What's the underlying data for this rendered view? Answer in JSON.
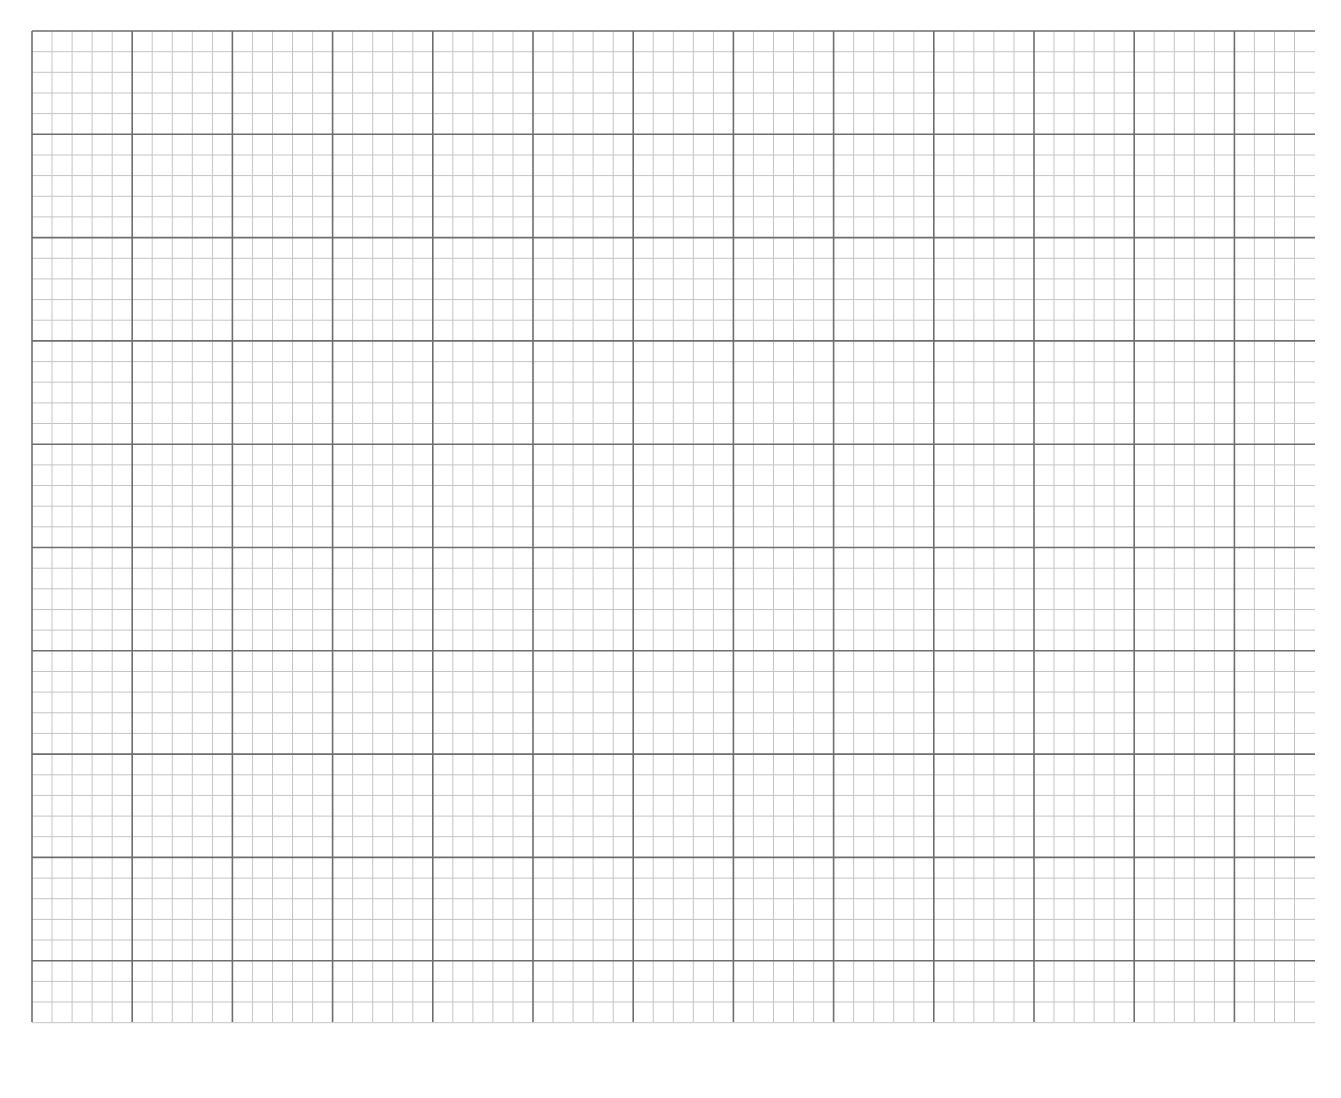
{
  "page": {
    "title": "",
    "background": "#ffffff"
  },
  "grid": {
    "origin_x": 32,
    "origin_y": 31,
    "major_step_x": 100.2,
    "major_step_y": 103.3,
    "minor_per_major": 5,
    "vertical_line_count": 64,
    "horizontal_line_count": 49,
    "h_line_end_x": 1315,
    "v_line_end_y": 1022,
    "major_color": "#6e6e6e",
    "minor_color": "#c4c4c4",
    "major_width": 1.6,
    "minor_width": 1
  }
}
